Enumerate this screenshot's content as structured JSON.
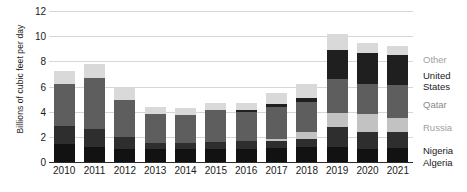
{
  "chart_data": {
    "type": "bar",
    "title": "",
    "xlabel": "",
    "ylabel": "Billions of cubic feet per day",
    "ylim": [
      0,
      12
    ],
    "yticks": [
      0,
      2,
      4,
      6,
      8,
      10,
      12
    ],
    "grid": true,
    "stacked": true,
    "legend_position": "right",
    "categories": [
      "2010",
      "2011",
      "2012",
      "2013",
      "2014",
      "2015",
      "2016",
      "2017",
      "2018",
      "2019",
      "2020",
      "2021"
    ],
    "series": [
      {
        "name": "Algeria",
        "color": "#121212",
        "values": [
          1.4,
          1.2,
          1.0,
          1.0,
          1.0,
          1.0,
          1.0,
          1.1,
          1.2,
          1.2,
          1.0,
          1.1
        ]
      },
      {
        "name": "Nigeria",
        "color": "#2e2e2e",
        "values": [
          1.5,
          1.4,
          1.0,
          0.5,
          0.5,
          0.6,
          0.7,
          0.6,
          0.6,
          1.6,
          1.4,
          1.3
        ]
      },
      {
        "name": "Russia",
        "color": "#c2c2c2",
        "values": [
          0.0,
          0.0,
          0.0,
          0.0,
          0.0,
          0.0,
          0.0,
          0.1,
          0.6,
          1.1,
          1.4,
          1.1
        ]
      },
      {
        "name": "Qatar",
        "color": "#5e5e5e",
        "values": [
          3.3,
          4.1,
          2.9,
          2.3,
          2.2,
          2.5,
          2.3,
          2.6,
          2.4,
          2.7,
          2.4,
          2.6
        ]
      },
      {
        "name": "United States",
        "color": "#1f1f1f",
        "values": [
          0.0,
          0.0,
          0.0,
          0.0,
          0.0,
          0.0,
          0.1,
          0.2,
          0.3,
          2.3,
          2.5,
          2.4
        ]
      },
      {
        "name": "Other",
        "color": "#d9d9d9",
        "values": [
          1.0,
          1.1,
          1.0,
          0.6,
          0.6,
          0.6,
          0.6,
          0.9,
          1.1,
          1.3,
          0.8,
          0.7
        ]
      }
    ],
    "totals": [
      7.2,
      7.8,
      5.9,
      4.4,
      4.3,
      4.7,
      4.7,
      5.5,
      6.2,
      10.2,
      9.5,
      9.2
    ]
  },
  "legend": {
    "items": [
      {
        "label": "Other",
        "top": 55
      },
      {
        "label": "United\nStates",
        "top": 71
      },
      {
        "label": "Qatar",
        "top": 100
      },
      {
        "label": "Russia",
        "top": 123
      },
      {
        "label": "Nigeria",
        "top": 146
      },
      {
        "label": "Algeria",
        "top": 158
      }
    ]
  }
}
